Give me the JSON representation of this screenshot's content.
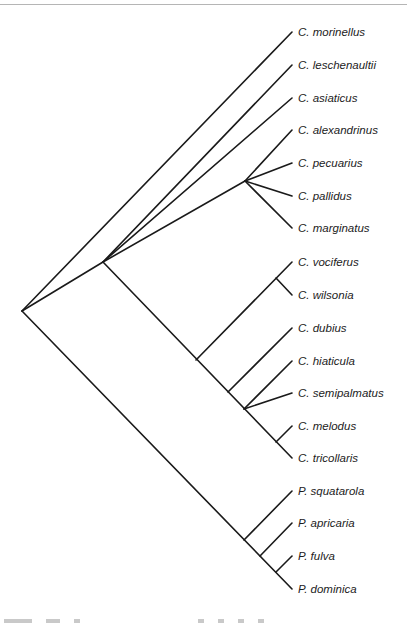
{
  "figure": {
    "type": "phylogenetic-tree",
    "line_color": "#1a1a1a",
    "label_color": "#1c1c1c",
    "rule_color": "#b5b5b5"
  },
  "leaves": [
    {
      "label": "C. morinellus",
      "x": 292,
      "y": 32
    },
    {
      "label": "C. leschenaultii",
      "x": 292,
      "y": 65
    },
    {
      "label": "C. asiaticus",
      "x": 292,
      "y": 98
    },
    {
      "label": "C. alexandrinus",
      "x": 292,
      "y": 130
    },
    {
      "label": "C. pecuarius",
      "x": 292,
      "y": 163
    },
    {
      "label": "C. pallidus",
      "x": 292,
      "y": 196
    },
    {
      "label": "C. marginatus",
      "x": 292,
      "y": 228
    },
    {
      "label": "C. vociferus",
      "x": 292,
      "y": 262
    },
    {
      "label": "C. wilsonia",
      "x": 292,
      "y": 295
    },
    {
      "label": "C. dubius",
      "x": 292,
      "y": 328
    },
    {
      "label": "C. hiaticula",
      "x": 292,
      "y": 361
    },
    {
      "label": "C. semipalmatus",
      "x": 292,
      "y": 393
    },
    {
      "label": "C. melodus",
      "x": 292,
      "y": 426
    },
    {
      "label": "C. tricollaris",
      "x": 292,
      "y": 458
    },
    {
      "label": "P. squatarola",
      "x": 292,
      "y": 491
    },
    {
      "label": "P. apricaria",
      "x": 292,
      "y": 523
    },
    {
      "label": "P. fulva",
      "x": 292,
      "y": 556
    },
    {
      "label": "P. dominica",
      "x": 292,
      "y": 589
    }
  ],
  "branches": [
    [
      22,
      311,
      292,
      32
    ],
    [
      22,
      311,
      103,
      262
    ],
    [
      103,
      262,
      292,
      65
    ],
    [
      103,
      262,
      292,
      98
    ],
    [
      103,
      262,
      245,
      181
    ],
    [
      245,
      181,
      292,
      130
    ],
    [
      245,
      181,
      292,
      163
    ],
    [
      245,
      181,
      292,
      196
    ],
    [
      245,
      181,
      292,
      228
    ],
    [
      103,
      262,
      292,
      458
    ],
    [
      196,
      360,
      292,
      262
    ],
    [
      276,
      278,
      292,
      295
    ],
    [
      228,
      392,
      292,
      328
    ],
    [
      244,
      409,
      292,
      361
    ],
    [
      244,
      409,
      292,
      393
    ],
    [
      276,
      442,
      292,
      426
    ],
    [
      22,
      311,
      292,
      589
    ],
    [
      244,
      540,
      292,
      491
    ],
    [
      260,
      556,
      292,
      523
    ],
    [
      276,
      572,
      292,
      556
    ]
  ]
}
